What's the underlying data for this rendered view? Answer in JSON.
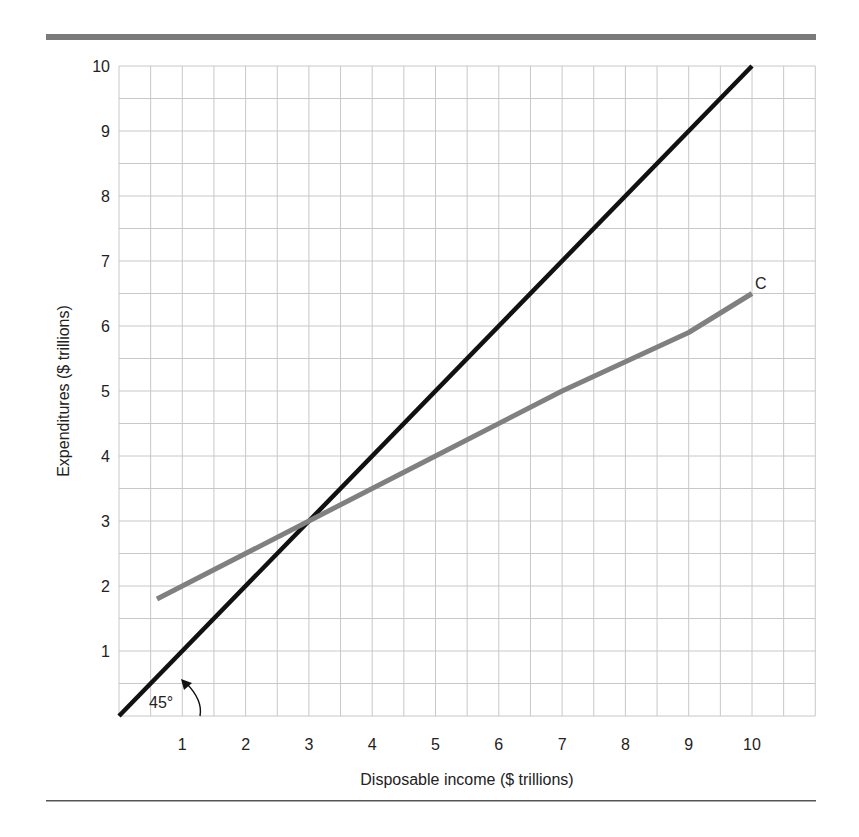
{
  "chart_data": {
    "type": "line",
    "title": "",
    "xlabel": "Disposable income ($ trillions)",
    "ylabel": "Expenditures ($ trillions)",
    "xlim": [
      0,
      11
    ],
    "ylim": [
      0,
      10
    ],
    "grid": true,
    "grid_step": 0.5,
    "x_ticks": [
      1,
      2,
      3,
      4,
      5,
      6,
      7,
      8,
      9,
      10
    ],
    "y_ticks": [
      1,
      2,
      3,
      4,
      5,
      6,
      7,
      8,
      9,
      10
    ],
    "series": [
      {
        "name": "45-degree line",
        "color": "#111111",
        "x": [
          0,
          10
        ],
        "y": [
          0,
          10
        ]
      },
      {
        "name": "C",
        "color": "#808080",
        "x": [
          0.6,
          1,
          3,
          5,
          7,
          9,
          10
        ],
        "y": [
          1.8,
          2.0,
          3.0,
          4.0,
          5.0,
          5.9,
          6.5
        ]
      }
    ],
    "annotations": [
      {
        "text": "45°",
        "x": 0.55,
        "y": 0.35,
        "note": "angle arc with arrow pointing to 45-degree line at (1,1)"
      },
      {
        "text": "C",
        "x": 10.25,
        "y": 6.7,
        "note": "label for consumption function"
      }
    ]
  },
  "labels": {
    "angle": "45°",
    "series_c": "C",
    "xlabel": "Disposable income ($ trillions)",
    "ylabel": "Expenditures ($ trillions)"
  },
  "colors": {
    "top_rule": "#7a7a7a",
    "bottom_rule": "#555555",
    "grid": "#c8c8c8",
    "line_45": "#111111",
    "line_c": "#808080"
  }
}
